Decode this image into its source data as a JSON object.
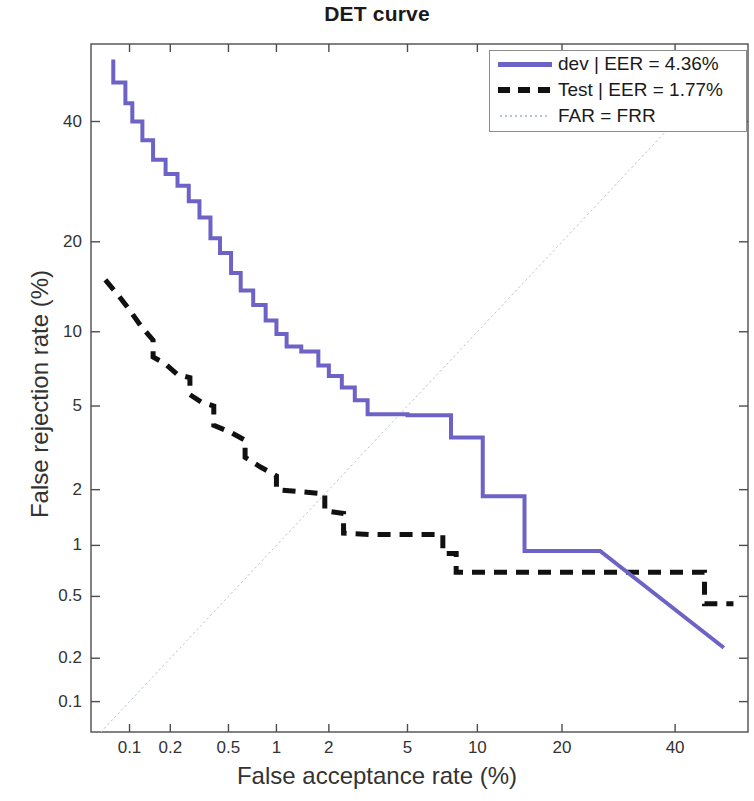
{
  "chart_data": {
    "type": "line",
    "title": "DET curve",
    "xlabel": "False acceptance rate (%)",
    "ylabel": "False rejection rate (%)",
    "scale": "normal-deviate (DET)",
    "grid": false,
    "legend_position": "top-right",
    "xlim": [
      0.05,
      55
    ],
    "ylim": [
      0.06,
      55
    ],
    "xticks": [
      "0.1",
      "0.2",
      "0.5",
      "1",
      "2",
      "5",
      "10",
      "20",
      "40"
    ],
    "xtick_values": [
      0.1,
      0.2,
      0.5,
      1,
      2,
      5,
      10,
      20,
      40
    ],
    "yticks": [
      "40",
      "20",
      "10",
      "5",
      "2",
      "1",
      "0.5",
      "0.2",
      "0.1"
    ],
    "ytick_values": [
      40,
      20,
      10,
      5,
      2,
      1,
      0.5,
      0.2,
      0.1
    ],
    "series": [
      {
        "name": "dev | EER = 4.36%",
        "label": "dev",
        "eer": "4.36%",
        "color": "#6d63c6",
        "style": "solid",
        "width": 4,
        "points": [
          [
            0.075,
            52.0
          ],
          [
            0.075,
            47.5
          ],
          [
            0.093,
            47.5
          ],
          [
            0.093,
            43.5
          ],
          [
            0.105,
            43.5
          ],
          [
            0.105,
            40.0
          ],
          [
            0.125,
            40.0
          ],
          [
            0.125,
            36.5
          ],
          [
            0.15,
            36.5
          ],
          [
            0.15,
            33.0
          ],
          [
            0.185,
            33.0
          ],
          [
            0.185,
            30.5
          ],
          [
            0.225,
            30.5
          ],
          [
            0.225,
            28.5
          ],
          [
            0.27,
            28.5
          ],
          [
            0.27,
            26.0
          ],
          [
            0.32,
            26.0
          ],
          [
            0.32,
            23.5
          ],
          [
            0.38,
            23.5
          ],
          [
            0.38,
            20.5
          ],
          [
            0.44,
            20.5
          ],
          [
            0.44,
            18.5
          ],
          [
            0.52,
            18.5
          ],
          [
            0.52,
            16.0
          ],
          [
            0.6,
            16.0
          ],
          [
            0.6,
            14.0
          ],
          [
            0.72,
            14.0
          ],
          [
            0.72,
            12.5
          ],
          [
            0.86,
            12.5
          ],
          [
            0.86,
            11.0
          ],
          [
            1.0,
            11.0
          ],
          [
            1.0,
            9.8
          ],
          [
            1.15,
            9.8
          ],
          [
            1.15,
            8.8
          ],
          [
            1.4,
            8.8
          ],
          [
            1.4,
            8.4
          ],
          [
            1.75,
            8.4
          ],
          [
            1.75,
            7.4
          ],
          [
            2.0,
            7.4
          ],
          [
            2.0,
            6.7
          ],
          [
            2.35,
            6.7
          ],
          [
            2.35,
            6.0
          ],
          [
            2.75,
            6.0
          ],
          [
            2.75,
            5.3
          ],
          [
            3.2,
            5.3
          ],
          [
            3.2,
            4.6
          ],
          [
            5.0,
            4.6
          ],
          [
            5.0,
            4.55
          ],
          [
            7.8,
            4.55
          ],
          [
            7.8,
            3.6
          ],
          [
            10.5,
            3.6
          ],
          [
            10.5,
            1.85
          ],
          [
            15.0,
            1.85
          ],
          [
            15.0,
            0.93
          ],
          [
            26.0,
            0.93
          ],
          [
            50.0,
            0.235
          ]
        ]
      },
      {
        "name": "Test | EER = 1.77%",
        "label": "Test",
        "eer": "1.77%",
        "color": "#111111",
        "style": "dashed",
        "width": 5,
        "points": [
          [
            0.065,
            15.2
          ],
          [
            0.082,
            13.5
          ],
          [
            0.1,
            12.0
          ],
          [
            0.122,
            10.5
          ],
          [
            0.15,
            9.3
          ],
          [
            0.15,
            8.0
          ],
          [
            0.185,
            7.5
          ],
          [
            0.225,
            6.8
          ],
          [
            0.275,
            6.6
          ],
          [
            0.275,
            5.6
          ],
          [
            0.33,
            5.2
          ],
          [
            0.4,
            5.0
          ],
          [
            0.4,
            4.1
          ],
          [
            0.52,
            3.8
          ],
          [
            0.64,
            3.5
          ],
          [
            0.64,
            2.9
          ],
          [
            0.8,
            2.6
          ],
          [
            1.0,
            2.35
          ],
          [
            1.0,
            2.0
          ],
          [
            1.4,
            1.95
          ],
          [
            1.9,
            1.9
          ],
          [
            1.9,
            1.55
          ],
          [
            2.4,
            1.5
          ],
          [
            2.4,
            1.17
          ],
          [
            3.4,
            1.15
          ],
          [
            7.2,
            1.15
          ],
          [
            7.2,
            0.9
          ],
          [
            8.2,
            0.9
          ],
          [
            8.2,
            0.7
          ],
          [
            33.0,
            0.7
          ],
          [
            46.0,
            0.7
          ],
          [
            46.0,
            0.45
          ],
          [
            52.0,
            0.45
          ]
        ]
      },
      {
        "name": "FAR = FRR",
        "label": "FAR = FRR",
        "color": "#b9c4d6",
        "style": "dotted",
        "width": 1,
        "points": [
          [
            0.06,
            0.06
          ],
          [
            52.0,
            52.0
          ]
        ]
      }
    ]
  },
  "legend": {
    "entries": [
      {
        "text": "dev | EER = 4.36%",
        "sample": "solid-line-sample"
      },
      {
        "text": "Test | EER = 1.77%",
        "sample": "dashed-line-sample"
      },
      {
        "text": "FAR = FRR",
        "sample": "dotted-line-sample"
      }
    ]
  },
  "colors": {
    "dev": "#6d63c6",
    "test": "#111111",
    "diagonal": "#b9c4d6",
    "axis": "#4d4d4d",
    "text": "#333333"
  }
}
